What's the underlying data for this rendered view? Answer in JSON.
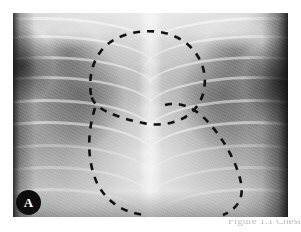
{
  "figure": {
    "panel_label": "A",
    "modality": "chest-radiograph",
    "view": "anteroposterior",
    "caption_fragment": "Figure 1.1 Chest"
  },
  "plate": {
    "left": 13,
    "top": 13,
    "width": 275,
    "height": 204,
    "background_hex": "#8f8f8f",
    "border_hex": "#0a0a0a"
  },
  "badge": {
    "label": "A",
    "background_hex": "#0d0d0d",
    "text_hex": "#ffffff",
    "diameter_px": 25
  },
  "annotations": {
    "stroke_hex": "#111111",
    "style": "dashed",
    "dash_pattern": "7 7",
    "stroke_width": 2.6,
    "regions": [
      {
        "name": "upper-mediastinal-outline",
        "description": "dashed contour around superior mediastinum / thymic shadow",
        "path": "M 78 82 C 74 54, 86 30, 112 22 C 140 13, 170 20, 184 42 C 196 60, 194 84, 180 98 C 168 110, 148 114, 130 110 C 110 106, 94 100, 86 94 C 82 91, 79 87, 78 82 Z"
      },
      {
        "name": "cardiac-silhouette-outline",
        "description": "dashed contour tracing the cardiac border and left heart margin",
        "path": "M 82 95 C 74 120, 74 148, 84 170 C 94 190, 112 200, 132 202"
      },
      {
        "name": "right-cardiac-border-outline",
        "description": "dashed contour sweeping from mid mediastinum to the right inferior field",
        "path": "M 152 92 C 166 88, 182 94, 196 110 C 212 128, 224 150, 228 170 C 231 186, 224 196, 210 202"
      }
    ]
  },
  "anatomy": {
    "ribs_left": 9,
    "ribs_right": 9,
    "spine_visible": true,
    "diaphragm_visible": true
  },
  "page": {
    "background_hex": "#ffffff",
    "width": 301,
    "height": 232
  }
}
